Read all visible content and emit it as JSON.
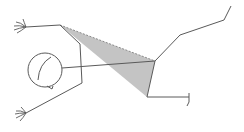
{
  "figure": {
    "colors": {
      "background": "#ffffff",
      "stroke": "#5a5a5a",
      "shade_fill": "#c4c4c4",
      "dashed_edge": "#8a8a8a"
    },
    "head": {
      "cx": 45,
      "cy": 70,
      "r": 17
    },
    "shaded_triangle": {
      "points": [
        [
          60,
          25
        ],
        [
          155,
          61
        ],
        [
          147,
          97
        ]
      ]
    },
    "strokes": {
      "upper_arm": [
        [
          26,
          27
        ],
        [
          60,
          25
        ]
      ],
      "torso_left": [
        [
          60,
          25
        ],
        [
          80,
          44
        ],
        [
          82,
          83
        ],
        [
          26,
          113
        ]
      ],
      "neck_line": [
        [
          62,
          68
        ],
        [
          155,
          61
        ]
      ],
      "right_upper_limb": [
        [
          155,
          61
        ],
        [
          180,
          35
        ],
        [
          224,
          20
        ],
        [
          231,
          6
        ]
      ],
      "right_lower_limb": [
        [
          147,
          97
        ],
        [
          189,
          97
        ]
      ],
      "right_lower_hook": [
        [
          189,
          93
        ],
        [
          189,
          102
        ],
        [
          187,
          106
        ]
      ]
    }
  }
}
